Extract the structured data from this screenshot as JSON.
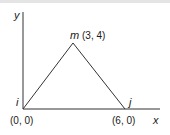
{
  "diagram": {
    "type": "triangle-element",
    "axes": {
      "x_label": "x",
      "y_label": "y"
    },
    "nodes": [
      {
        "id": "i",
        "label": "i",
        "coord_label": "(0, 0)",
        "x": 0,
        "y": 0
      },
      {
        "id": "j",
        "label": "j",
        "coord_label": "(6, 0)",
        "x": 6,
        "y": 0
      },
      {
        "id": "m",
        "label": "m",
        "coord_label": "(3, 4)",
        "x": 3,
        "y": 4
      }
    ],
    "edges": [
      [
        "i",
        "m"
      ],
      [
        "m",
        "j"
      ],
      [
        "i",
        "j"
      ]
    ],
    "colors": {
      "line": "#333333",
      "text": "#1a1a1a",
      "background": "#ffffff"
    }
  }
}
